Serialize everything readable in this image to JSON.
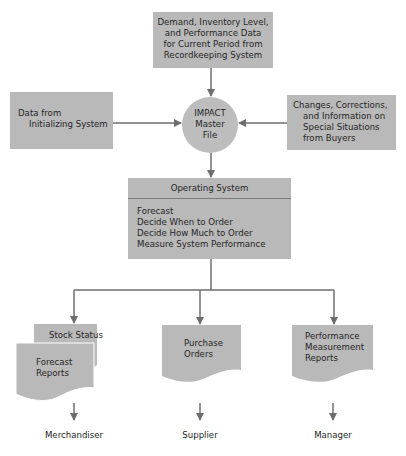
{
  "diagram": {
    "top_box": {
      "lines": [
        "Demand, Inventory Level,",
        "and Performance Data",
        "for Current Period from",
        "Recordkeeping System"
      ]
    },
    "left_box": {
      "lines": [
        "Data from",
        "Initializing System"
      ]
    },
    "right_box": {
      "lines": [
        "Changes, Corrections,",
        "and Information on",
        "Special Situations",
        "from Buyers"
      ]
    },
    "master_file": {
      "lines": [
        "IMPACT",
        "Master",
        "File"
      ]
    },
    "operating_system": {
      "title": "Operating System",
      "functions": [
        "Forecast",
        "Decide When to Order",
        "Decide How Much to Order",
        "Measure System Performance"
      ]
    },
    "outputs": [
      {
        "documents": [
          {
            "lines": [
              "Stock Status"
            ]
          },
          {
            "lines": [
              "Forecast",
              "Reports"
            ]
          }
        ],
        "recipient": "Merchandiser"
      },
      {
        "documents": [
          {
            "lines": [
              "Purchase",
              "Orders"
            ]
          }
        ],
        "recipient": "Supplier"
      },
      {
        "documents": [
          {
            "lines": [
              "Performance",
              "Measurement",
              "Reports"
            ]
          }
        ],
        "recipient": "Manager"
      }
    ],
    "colors": {
      "box_fill": "#b9b9b9",
      "line": "#6e6e6e",
      "background": "#ffffff"
    }
  }
}
